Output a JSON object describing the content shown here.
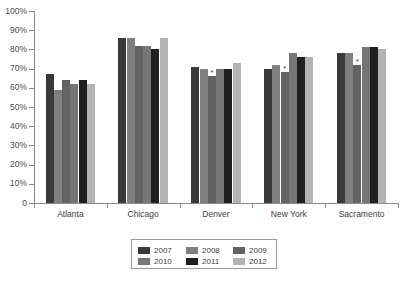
{
  "chart_data": {
    "type": "bar",
    "title": "",
    "subtitle": "",
    "xlabel": "",
    "ylabel": "",
    "ylim": [
      0,
      100
    ],
    "ytick_labels": [
      "0",
      "10%",
      "20%",
      "30%",
      "40%",
      "50%",
      "60%",
      "70%",
      "80%",
      "90%",
      "100%"
    ],
    "ytick_values": [
      0,
      10,
      20,
      30,
      40,
      50,
      60,
      70,
      80,
      90,
      100
    ],
    "grid": false,
    "legend_position": "bottom",
    "orientation": "vertical",
    "categories": [
      "Atlanta",
      "Chicago",
      "Denver",
      "New York",
      "Sacramento"
    ],
    "series": [
      {
        "name": "2007",
        "color": "#3a3a3a",
        "values": [
          67,
          86,
          71,
          70,
          78
        ]
      },
      {
        "name": "2008",
        "color": "#808080",
        "values": [
          59,
          86,
          70,
          72,
          78
        ]
      },
      {
        "name": "2009",
        "color": "#636363",
        "values": [
          64,
          82,
          66,
          68,
          72
        ]
      },
      {
        "name": "2010",
        "color": "#767676",
        "values": [
          62,
          82,
          70,
          78,
          81
        ]
      },
      {
        "name": "2011",
        "color": "#1f1f1f",
        "values": [
          64,
          80,
          70,
          76,
          81
        ]
      },
      {
        "name": "2012",
        "color": "#b3b3b3",
        "values": [
          62,
          86,
          73,
          76,
          80
        ]
      }
    ],
    "annotations": [
      {
        "category": "Denver",
        "series": "2009",
        "marker": "*"
      },
      {
        "category": "New York",
        "series": "2009",
        "marker": "*"
      },
      {
        "category": "Sacramento",
        "series": "2009",
        "marker": "*"
      }
    ]
  },
  "legend": {
    "entries": [
      "2007",
      "2008",
      "2009",
      "2010",
      "2011",
      "2012"
    ]
  }
}
